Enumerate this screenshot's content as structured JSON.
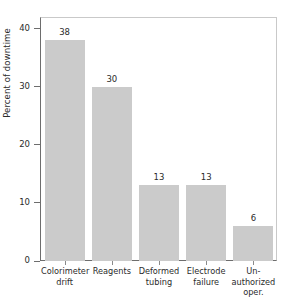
{
  "chart_data": {
    "type": "bar",
    "title": "",
    "subtitle": "",
    "xlabel": "",
    "ylabel": "Percent of downtime",
    "categories": [
      "Colorimeter drift",
      "Reagents",
      "Deformed tubing",
      "Electrode failure",
      "Un-authorized oper."
    ],
    "category_lines": [
      [
        "Colorimeter",
        "drift"
      ],
      [
        "Reagents"
      ],
      [
        "Deformed",
        "tubing"
      ],
      [
        "Electrode",
        "failure"
      ],
      [
        "Un-",
        "authorized",
        "oper."
      ]
    ],
    "values": [
      38,
      30,
      13,
      13,
      6
    ],
    "value_labels": [
      "38",
      "30",
      "13",
      "13",
      "6"
    ],
    "ylim": [
      0,
      42
    ],
    "yticks": [
      0,
      10,
      20,
      30,
      40
    ],
    "ytick_labels": [
      "0",
      "10",
      "20",
      "30",
      "40"
    ],
    "grid": false,
    "legend": null,
    "legend_position": "none",
    "bar_color": "#cbcbcb",
    "axis_color": "#6d6d6d",
    "frame_color": "#c9c9c9",
    "text_color": "#2b2b2b",
    "background": "#ffffff"
  }
}
